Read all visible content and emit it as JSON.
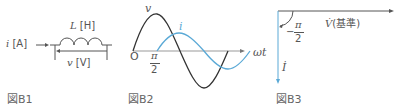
{
  "figures": [
    {
      "id": "B1",
      "caption": "図B1",
      "labels": {
        "current": "i",
        "current_unit": "[A]",
        "inductance": "L",
        "inductance_unit": "[H]",
        "voltage": "v",
        "voltage_unit": "[V]"
      }
    },
    {
      "id": "B2",
      "caption": "図B2",
      "labels": {
        "voltage_curve": "v",
        "current_curve": "i",
        "origin": "O",
        "phase_num": "π",
        "phase_den": "2",
        "x_axis": "ωt"
      }
    },
    {
      "id": "B3",
      "caption": "図B3",
      "labels": {
        "angle_sign": "−",
        "angle_num": "π",
        "angle_den": "2",
        "voltage_phasor": "V̇",
        "reference_note": "(基準)",
        "current_phasor": "İ"
      }
    }
  ],
  "colors": {
    "voltage": "#333333",
    "current": "#5aa9d6",
    "axis": "#555555"
  }
}
